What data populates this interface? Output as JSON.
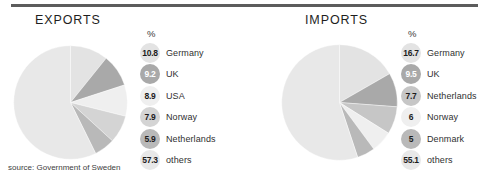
{
  "top_rule_color": "#5c5c5c",
  "source_note": "source: Government of Sweden",
  "panels": {
    "exports": {
      "title": "EXPORTS",
      "percent_header": "%"
    },
    "imports": {
      "title": "IMPORTS",
      "percent_header": "%"
    }
  },
  "chart_data": [
    {
      "type": "pie",
      "title": "EXPORTS",
      "ylabel": "%",
      "unit": "%",
      "legend_position": "right",
      "categories": [
        "Germany",
        "UK",
        "USA",
        "Norway",
        "Netherlands",
        "others"
      ],
      "values": [
        10.8,
        9.2,
        8.9,
        7.9,
        5.9,
        57.3
      ],
      "value_labels": [
        "10.8",
        "9.2",
        "8.9",
        "7.9",
        "5.9",
        "57.3"
      ],
      "colors": [
        "#e3e3e3",
        "#a9a9a9",
        "#efefef",
        "#d4d4d4",
        "#b9b9b9",
        "#e8e8e8"
      ],
      "text_on_dark": [
        false,
        true,
        false,
        false,
        false,
        false
      ],
      "start_angle_deg": 0
    },
    {
      "type": "pie",
      "title": "IMPORTS",
      "ylabel": "%",
      "unit": "%",
      "legend_position": "right",
      "categories": [
        "Germany",
        "UK",
        "Netherlands",
        "Norway",
        "Denmark",
        "others"
      ],
      "values": [
        16.7,
        9.5,
        7.7,
        6,
        5,
        55.1
      ],
      "value_labels": [
        "16.7",
        "9.5",
        "7.7",
        "6",
        "5",
        "55.1"
      ],
      "colors": [
        "#e3e3e3",
        "#a9a9a9",
        "#c6c6c6",
        "#efefef",
        "#b9b9b9",
        "#e8e8e8"
      ],
      "text_on_dark": [
        false,
        true,
        false,
        false,
        false,
        false
      ],
      "start_angle_deg": 0
    }
  ]
}
